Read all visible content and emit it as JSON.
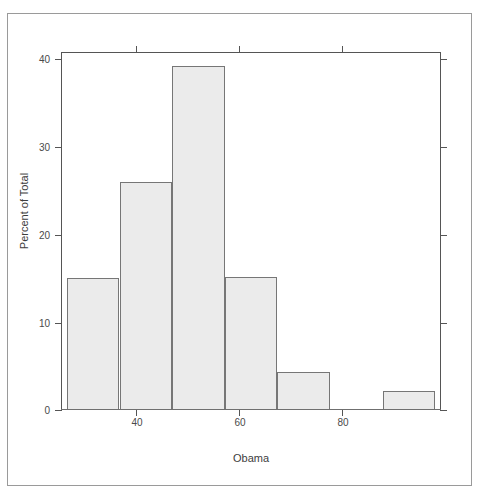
{
  "figure": {
    "background_color": "#ffffff",
    "frame_color": "#555555",
    "bar_fill_color": "#ebebeb",
    "bar_border_color": "#767676"
  },
  "chart_data": {
    "type": "bar",
    "title": "",
    "subtitle": "",
    "xlabel": "Obama",
    "ylabel": "Percent of Total",
    "grid": false,
    "legend": false,
    "legend_position": "none",
    "xlim": [
      30.5,
      95.5
    ],
    "ylim": [
      0,
      40
    ],
    "xticks": [
      40,
      60,
      80
    ],
    "xtick_labels": [
      "40",
      "60",
      "80"
    ],
    "yticks": [
      0,
      10,
      20,
      30,
      40
    ],
    "ytick_labels": [
      "0",
      "10",
      "20",
      "30",
      "40"
    ],
    "bin_width": 9,
    "bin_edges": [
      31.5,
      40.5,
      49.5,
      58.5,
      67.5,
      76.5,
      85.5,
      94.5
    ],
    "categories": [
      "31.5-40.5",
      "40.5-49.5",
      "49.5-58.5",
      "58.5-67.5",
      "67.5-76.5",
      "76.5-85.5",
      "85.5-94.5"
    ],
    "values": [
      14.8,
      25.5,
      38.4,
      14.9,
      4.3,
      0,
      2.1
    ],
    "annotations": []
  }
}
